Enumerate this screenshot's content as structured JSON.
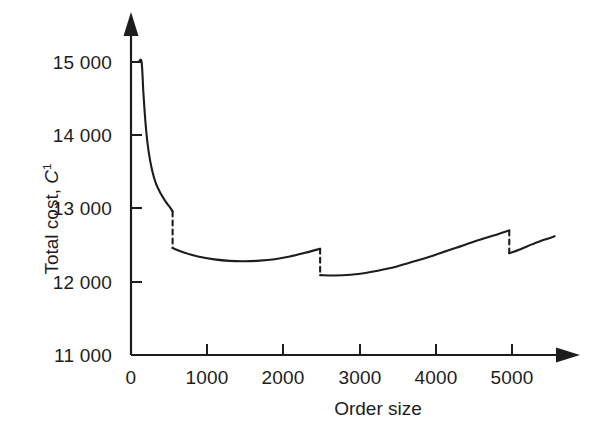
{
  "chart_data": {
    "type": "line",
    "title": "",
    "xlabel": "Order size",
    "ylabel": "Total cost, C¹",
    "ylabel_text": "Total cost,",
    "ylabel_var": "C",
    "ylabel_sup": "1",
    "xlim": [
      0,
      5600
    ],
    "ylim": [
      11000,
      15400
    ],
    "xticks": [
      0,
      1000,
      2000,
      3000,
      4000,
      5000
    ],
    "xtick_labels": [
      "0",
      "1000",
      "2000",
      "3000",
      "4000",
      "5000"
    ],
    "yticks": [
      11000,
      12000,
      13000,
      14000,
      15000
    ],
    "ytick_labels": [
      "11 000",
      "12 000",
      "13 000",
      "14 000",
      "15 000"
    ],
    "grid": false,
    "legend": null,
    "line_color": "#1d1d1d",
    "axis_color": "#1d1d1d",
    "x_axis_arrow": true,
    "y_axis_arrow": true,
    "series": [
      {
        "name": "Total cost segment 1",
        "style": "solid",
        "points": [
          [
            100,
            15000
          ],
          [
            140,
            15000
          ],
          [
            165,
            14560
          ],
          [
            195,
            14130
          ],
          [
            230,
            13800
          ],
          [
            275,
            13540
          ],
          [
            330,
            13340
          ],
          [
            395,
            13200
          ],
          [
            460,
            13090
          ],
          [
            520,
            13010
          ],
          [
            550,
            12960
          ]
        ]
      },
      {
        "name": "Price break drop at 550",
        "style": "dashed",
        "points": [
          [
            550,
            12960
          ],
          [
            550,
            12460
          ]
        ]
      },
      {
        "name": "Total cost segment 2",
        "style": "solid",
        "points": [
          [
            550,
            12460
          ],
          [
            700,
            12400
          ],
          [
            900,
            12340
          ],
          [
            1100,
            12305
          ],
          [
            1300,
            12285
          ],
          [
            1500,
            12280
          ],
          [
            1700,
            12288
          ],
          [
            1900,
            12308
          ],
          [
            2100,
            12345
          ],
          [
            2300,
            12395
          ],
          [
            2500,
            12450
          ]
        ]
      },
      {
        "name": "Price break drop at 2500",
        "style": "dashed",
        "points": [
          [
            2500,
            12450
          ],
          [
            2500,
            12090
          ]
        ]
      },
      {
        "name": "Total cost segment 3",
        "style": "solid",
        "points": [
          [
            2500,
            12090
          ],
          [
            2700,
            12085
          ],
          [
            2900,
            12095
          ],
          [
            3100,
            12120
          ],
          [
            3400,
            12180
          ],
          [
            3700,
            12265
          ],
          [
            4000,
            12360
          ],
          [
            4300,
            12465
          ],
          [
            4600,
            12570
          ],
          [
            4850,
            12650
          ],
          [
            5000,
            12700
          ]
        ]
      },
      {
        "name": "Price break drop at 5000",
        "style": "dashed",
        "points": [
          [
            5000,
            12700
          ],
          [
            5000,
            12390
          ]
        ]
      },
      {
        "name": "Total cost segment 4",
        "style": "solid",
        "points": [
          [
            5000,
            12390
          ],
          [
            5150,
            12445
          ],
          [
            5300,
            12510
          ],
          [
            5450,
            12570
          ],
          [
            5600,
            12620
          ]
        ]
      }
    ],
    "breaks": [
      {
        "order_size": 550,
        "cost_before": 12960,
        "cost_after": 12460
      },
      {
        "order_size": 2500,
        "cost_before": 12450,
        "cost_after": 12090
      },
      {
        "order_size": 5000,
        "cost_before": 12700,
        "cost_after": 12390
      }
    ]
  }
}
